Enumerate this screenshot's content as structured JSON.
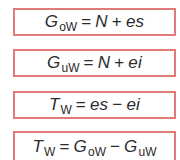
{
  "colors": {
    "box_border": "#e27a7a",
    "text": "#2b2b2b",
    "background": "#ffffff"
  },
  "formulas": [
    {
      "id": "upper-limit-size",
      "lhs": {
        "symbol": "G",
        "subscript": "oW"
      },
      "op1": "=",
      "term1": {
        "symbol": "N"
      },
      "op2": "+",
      "term2": {
        "symbol": "es"
      }
    },
    {
      "id": "lower-limit-size",
      "lhs": {
        "symbol": "G",
        "subscript": "uW"
      },
      "op1": "=",
      "term1": {
        "symbol": "N"
      },
      "op2": "+",
      "term2": {
        "symbol": "ei"
      }
    },
    {
      "id": "tolerance-deviations",
      "lhs": {
        "symbol": "T",
        "subscript": "W"
      },
      "op1": "=",
      "term1": {
        "symbol": "es"
      },
      "op2": "−",
      "term2": {
        "symbol": "ei"
      }
    },
    {
      "id": "tolerance-limits",
      "lhs": {
        "symbol": "T",
        "subscript": "W"
      },
      "op1": "=",
      "term1": {
        "symbol": "G",
        "subscript": "oW"
      },
      "op2": "−",
      "term2": {
        "symbol": "G",
        "subscript": "uW"
      }
    }
  ]
}
